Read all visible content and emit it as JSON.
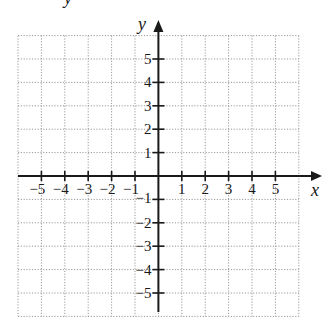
{
  "header": {
    "cropped_fragment": "y"
  },
  "chart_data": {
    "type": "scatter",
    "title": "",
    "xlabel": "x",
    "ylabel": "y",
    "xlim": [
      -6,
      6
    ],
    "ylim": [
      -6,
      6
    ],
    "grid": true,
    "grid_style": "dotted",
    "x_ticks": [
      -5,
      -4,
      -3,
      -2,
      -1,
      1,
      2,
      3,
      4,
      5
    ],
    "y_ticks": [
      -5,
      -4,
      -3,
      -2,
      -1,
      1,
      2,
      3,
      4,
      5
    ],
    "x_tick_labels": [
      "−5",
      "−4",
      "−3",
      "−2",
      "−1",
      "1",
      "2",
      "3",
      "4",
      "5"
    ],
    "y_tick_labels": [
      "−5",
      "−4",
      "−3",
      "−2",
      "−1",
      "1",
      "2",
      "3",
      "4",
      "5"
    ],
    "series": [],
    "legend": null,
    "colors": {
      "axis": "#1a1a1a",
      "grid": "#9a9a9a",
      "background": "#ffffff"
    }
  }
}
